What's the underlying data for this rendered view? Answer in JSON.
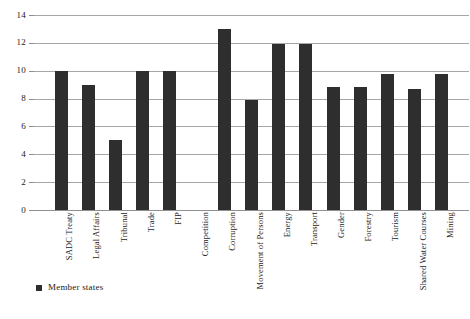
{
  "chart_data": {
    "type": "bar",
    "title": "",
    "xlabel": "",
    "ylabel": "",
    "ylim": [
      0,
      14
    ],
    "y_ticks": [
      0,
      2,
      4,
      6,
      8,
      10,
      12,
      14
    ],
    "grid": true,
    "legend_position": "bottom-left",
    "legend": [
      "Member states"
    ],
    "bar_color": "#2e2e2e",
    "gridline_color": "#a6a6a6",
    "categories": [
      "SADC Treaty",
      "Legal Affairs",
      "Tribunal",
      "Trade",
      "FIP",
      "Competition",
      "Corruption",
      "Movement of Persons",
      "Energy",
      "Transport",
      "Gender",
      "Forestry",
      "Tourism",
      "Shared Water Courses",
      "Mining"
    ],
    "series": [
      {
        "name": "Member states",
        "values": [
          10,
          9,
          5,
          10,
          10,
          0,
          13,
          7.9,
          11.9,
          11.9,
          8.8,
          8.8,
          9.8,
          8.7,
          9.8
        ]
      }
    ]
  }
}
